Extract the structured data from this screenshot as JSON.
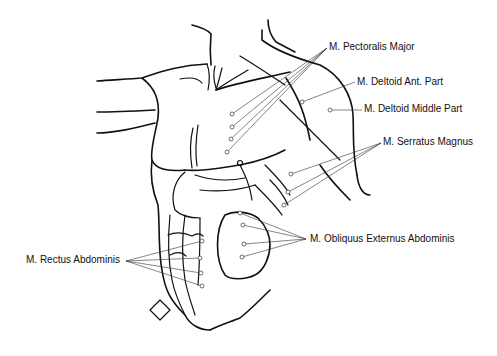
{
  "diagram": {
    "type": "anatomical-illustration",
    "labels": [
      {
        "id": "pectoralis-major",
        "text": "M. Pectoralis Major",
        "x": 329,
        "y": 41
      },
      {
        "id": "deltoid-ant",
        "text": "M. Deltoid Ant. Part",
        "x": 357,
        "y": 76
      },
      {
        "id": "deltoid-middle",
        "text": "M. Deltoid Middle Part",
        "x": 364,
        "y": 103
      },
      {
        "id": "serratus-magnus",
        "text": "M. Serratus Magnus",
        "x": 383,
        "y": 136
      },
      {
        "id": "obliquus-externus",
        "text": "M. Obliquus Externus Abdominis",
        "x": 310,
        "y": 233
      },
      {
        "id": "rectus-abdominis",
        "text": "M. Rectus Abdominis",
        "x": 26,
        "y": 254
      }
    ],
    "colors": {
      "line": "#111111",
      "background": "#ffffff"
    }
  }
}
